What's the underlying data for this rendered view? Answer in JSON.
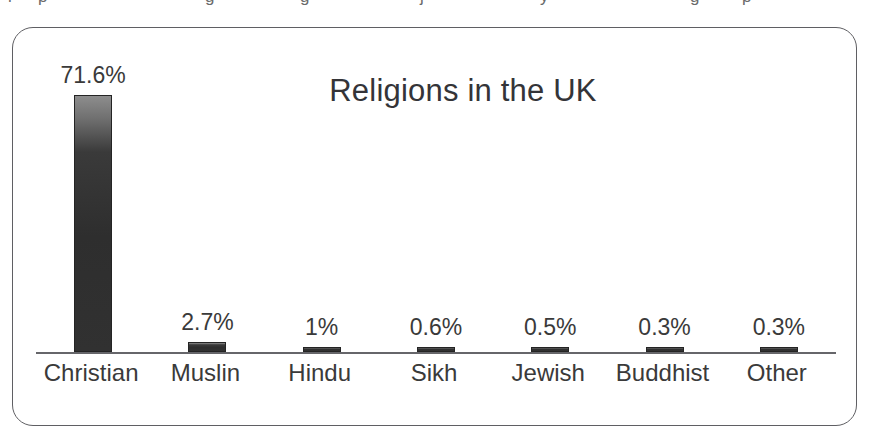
{
  "scan_artifacts": {
    "top_fragments": [
      {
        "text": "l",
        "left": 8
      },
      {
        "text": "p",
        "left": 38
      },
      {
        "text": "g",
        "left": 205
      },
      {
        "text": "g",
        "left": 300
      },
      {
        "text": "j",
        "left": 420
      },
      {
        "text": "y",
        "left": 540
      },
      {
        "text": "g",
        "left": 690
      },
      {
        "text": "p",
        "left": 742
      }
    ]
  },
  "chart_data": {
    "type": "bar",
    "title": "Religions in the UK",
    "xlabel": "",
    "ylabel": "",
    "categories": [
      "Christian",
      "Muslin",
      "Hindu",
      "Sikh",
      "Jewish",
      "Buddhist",
      "Other"
    ],
    "values": [
      71.6,
      2.7,
      1,
      0.6,
      0.5,
      0.3,
      0.3
    ],
    "value_labels": [
      "71.6%",
      "2.7%",
      "1%",
      "0.6%",
      "0.5%",
      "0.3%",
      "0.3%"
    ],
    "ylim": [
      0,
      82
    ],
    "grid": false,
    "legend": false,
    "bar_color": "#2e2e2e",
    "axis_color": "#66666a",
    "frame_color": "#5f5f63",
    "background": "#ffffff"
  }
}
